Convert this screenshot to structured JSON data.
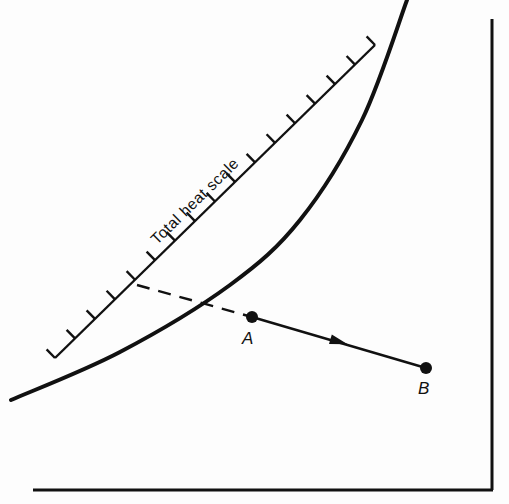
{
  "diagram": {
    "scale": {
      "label": "Total heat scale",
      "start": [
        55,
        358
      ],
      "end": [
        375,
        45
      ],
      "tick_count": 17,
      "tick_length": 12,
      "reference_tick_index": 3
    },
    "saturation_curve": {
      "points": [
        [
          11,
          400
        ],
        [
          120,
          352
        ],
        [
          230,
          285
        ],
        [
          300,
          220
        ],
        [
          362,
          120
        ],
        [
          407,
          0
        ]
      ]
    },
    "projection": {
      "from": [
        137,
        285
      ],
      "to": [
        252,
        317
      ],
      "style": "dashed"
    },
    "process": {
      "point_a": {
        "label": "A",
        "x": 252,
        "y": 317
      },
      "point_b": {
        "label": "B",
        "x": 426,
        "y": 368
      },
      "arrow_at": [
        340,
        342
      ]
    },
    "axes": {
      "bottom": {
        "x1": 33,
        "y": 490,
        "x2": 493
      },
      "right": {
        "x": 492,
        "y1": 19,
        "y2": 490
      }
    },
    "colors": {
      "ink": "#111111",
      "paper": "#fdfdfd"
    }
  }
}
